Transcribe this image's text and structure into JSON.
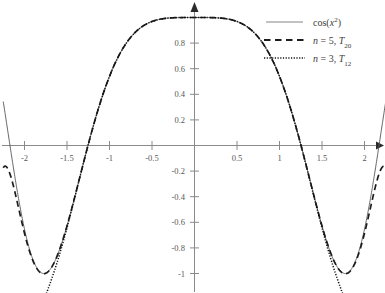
{
  "chart_data": {
    "type": "line",
    "title": "",
    "xlabel": "",
    "ylabel": "",
    "xlim": [
      -2.25,
      2.25
    ],
    "ylim": [
      -1.15,
      1.08
    ],
    "grid": false,
    "legend_position": "top-right",
    "x_ticks": [
      -2,
      -1.5,
      -1,
      -0.5,
      0.5,
      1,
      1.5,
      2
    ],
    "x_tick_labels": [
      "-2",
      "-1.5",
      "-1",
      "-0.5",
      "0.5",
      "1",
      "1.5",
      "2"
    ],
    "y_ticks": [
      1,
      0.8,
      0.6,
      0.4,
      0.2,
      -0.2,
      -0.4,
      -0.6,
      -0.8,
      -1
    ],
    "y_tick_labels": [
      "",
      "0.8",
      "0.6",
      "0.4",
      "0.2",
      "-0.2",
      "-0.4",
      "-0.6",
      "-0.8",
      "-1"
    ],
    "series": [
      {
        "name": "cos(x^2)",
        "legend_label": "cos(x",
        "legend_label_sup": "2",
        "legend_label_tail": ")",
        "style": "solid",
        "color": "#555555",
        "description": "Exact function cos(x squared), symmetric about x=0, peak value 1 at x=0, minima near -1 at x = +/-1.77, rising steeply at the plot edges."
      },
      {
        "name": "n = 5, T20",
        "legend_label_n": "n",
        "legend_label_eq": "= 5,",
        "legend_label_T": "T",
        "legend_label_sub": "20",
        "style": "dashed",
        "color": "#1d1d1d",
        "description": "Degree-20 Taylor/Chebyshev approximation with n=5; matches cos(x^2) on roughly -1.8 to 1.8 then diverges downward off the bottom of the plot."
      },
      {
        "name": "n = 3, T12",
        "legend_label_n": "n",
        "legend_label_eq": "= 3,",
        "legend_label_T": "T",
        "legend_label_sub": "12",
        "style": "dotted",
        "color": "#111111",
        "description": "Degree-12 Taylor/Chebyshev approximation with n=3; matches cos(x^2) on roughly -1.75 to 1.75 then diverges downward off the bottom of the plot."
      }
    ],
    "sampled_points": {
      "x": [
        -2.25,
        -2.1,
        -2.0,
        -1.9,
        -1.8,
        -1.77,
        -1.7,
        -1.6,
        -1.5,
        -1.4,
        -1.3,
        -1.2,
        -1.1,
        -1.0,
        -0.9,
        -0.8,
        -0.7,
        -0.6,
        -0.5,
        -0.4,
        -0.3,
        -0.2,
        -0.1,
        0.0,
        0.1,
        0.2,
        0.3,
        0.4,
        0.5,
        0.6,
        0.7,
        0.8,
        0.9,
        1.0,
        1.1,
        1.2,
        1.3,
        1.4,
        1.5,
        1.6,
        1.7,
        1.77,
        1.8,
        1.9,
        2.0,
        2.1,
        2.25
      ],
      "cos_x2": [
        0.0707,
        -0.602,
        -0.8947,
        -0.9962,
        -0.9477,
        -0.9999,
        -0.9525,
        -0.7934,
        -0.6282,
        -0.378,
        -0.0856,
        0.2272,
        0.5107,
        0.5403,
        0.79,
        0.9423,
        0.9881,
        0.936,
        0.9689,
        0.9872,
        0.996,
        0.9992,
        0.9999,
        1.0,
        0.9999,
        0.9992,
        0.996,
        0.9872,
        0.9689,
        0.936,
        0.9881,
        0.9423,
        0.79,
        0.5403,
        0.5107,
        0.2272,
        -0.0856,
        -0.378,
        -0.6282,
        -0.7934,
        -0.9525,
        -0.9999,
        -0.9477,
        -0.9962,
        -0.8947,
        -0.602,
        0.0707
      ]
    }
  },
  "legend": {
    "entries": [
      {
        "style": "solid",
        "label": "cos(x²)"
      },
      {
        "style": "dashed",
        "label": "n = 5, T₂₀"
      },
      {
        "style": "dotted",
        "label": "n = 3, T₁₂"
      }
    ]
  }
}
